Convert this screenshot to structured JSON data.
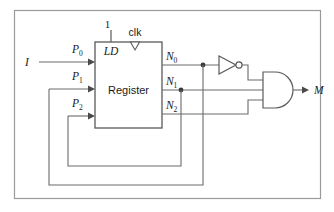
{
  "figure": {
    "type": "logic-circuit-diagram",
    "colors": {
      "wire": "#6b6b6b",
      "outline": "#5a5a5a",
      "frame": "#9a9a9a",
      "text": "#1a1a1a",
      "background": "#ffffff"
    }
  },
  "inputs": {
    "primary": {
      "label": "I",
      "name": "circuit-input-I"
    },
    "load": {
      "label": "1",
      "name": "constant-one"
    },
    "clock": {
      "label": "clk",
      "name": "clock-input"
    }
  },
  "register": {
    "label": "Register",
    "load_pin_label": "LD",
    "input_pins": [
      {
        "label": "P",
        "subscript": "0"
      },
      {
        "label": "P",
        "subscript": "1"
      },
      {
        "label": "P",
        "subscript": "2"
      }
    ],
    "output_pins": [
      {
        "label": "N",
        "subscript": "0"
      },
      {
        "label": "N",
        "subscript": "1"
      },
      {
        "label": "N",
        "subscript": "2"
      }
    ]
  },
  "gates": [
    {
      "name": "inverter",
      "type": "NOT",
      "input": "N0",
      "label": ""
    },
    {
      "name": "and-gate",
      "type": "AND",
      "inputs": [
        "NOT N0",
        "N1",
        "N2"
      ],
      "label": ""
    }
  ],
  "outputs": {
    "primary": {
      "label": "M",
      "name": "circuit-output-M"
    }
  },
  "feedback": [
    {
      "from": "N0",
      "to": "P1",
      "name": "feedback-n0-to-p1"
    },
    {
      "from": "N1",
      "to": "P2",
      "name": "feedback-n1-to-p2"
    }
  ]
}
